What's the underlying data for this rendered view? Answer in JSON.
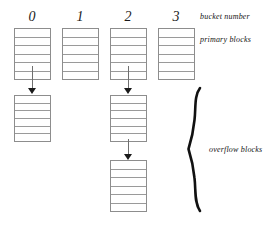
{
  "diagram": {
    "background_color": "#ffffff",
    "line_color": "#8d8d8d",
    "text_color": "#141414",
    "columns": [
      {
        "bucket_number": "0",
        "primary_cells": 6,
        "overflow_blocks": 1
      },
      {
        "bucket_number": "1",
        "primary_cells": 6,
        "overflow_blocks": 0
      },
      {
        "bucket_number": "2",
        "primary_cells": 6,
        "overflow_blocks": 2
      },
      {
        "bucket_number": "3",
        "primary_cells": 6,
        "overflow_blocks": 0
      }
    ],
    "labels": {
      "bucket_number": "bucket number",
      "primary_blocks": "primary blocks",
      "overflow_blocks": "overflow blocks"
    }
  }
}
